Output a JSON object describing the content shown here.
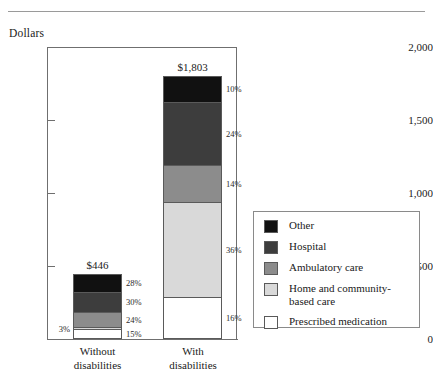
{
  "top_rule": "",
  "axis": {
    "y_title": "Dollars",
    "y_ticks": [
      "2,000",
      "1,500",
      "1,000",
      "500",
      "0"
    ],
    "y_tick_values": [
      2000,
      1500,
      1000,
      500,
      0
    ],
    "y_min": 0,
    "y_max": 2000
  },
  "bars": [
    {
      "category": "Without",
      "category_line2": "disabilities",
      "value_label": "$446",
      "value": 446,
      "segments": [
        {
          "name": "Other",
          "pct_label": "28%",
          "pct": 28,
          "color": "#111111",
          "label_side": "right"
        },
        {
          "name": "Hospital",
          "pct_label": "30%",
          "pct": 30,
          "color": "#3d3d3d",
          "label_side": "right"
        },
        {
          "name": "Ambulatory care",
          "pct_label": "24%",
          "pct": 24,
          "color": "#8c8c8c",
          "label_side": "right"
        },
        {
          "name": "Home and community-based care",
          "pct_label": "3%",
          "pct": 3,
          "color": "#d9d9d9",
          "label_side": "left"
        },
        {
          "name": "Prescribed medication",
          "pct_label": "15%",
          "pct": 15,
          "color": "#ffffff",
          "label_side": "right"
        }
      ]
    },
    {
      "category": "With",
      "category_line2": "disabilities",
      "value_label": "$1,803",
      "value": 1803,
      "segments": [
        {
          "name": "Other",
          "pct_label": "10%",
          "pct": 10,
          "color": "#111111",
          "label_side": "right"
        },
        {
          "name": "Hospital",
          "pct_label": "24%",
          "pct": 24,
          "color": "#3d3d3d",
          "label_side": "right"
        },
        {
          "name": "Ambulatory care",
          "pct_label": "14%",
          "pct": 14,
          "color": "#8c8c8c",
          "label_side": "right"
        },
        {
          "name": "Home and community-based care",
          "pct_label": "36%",
          "pct": 36,
          "color": "#d9d9d9",
          "label_side": "right"
        },
        {
          "name": "Prescribed medication",
          "pct_label": "16%",
          "pct": 16,
          "color": "#ffffff",
          "label_side": "right"
        }
      ]
    }
  ],
  "legend": {
    "items": [
      {
        "label": "Other",
        "color": "#111111"
      },
      {
        "label": "Hospital",
        "color": "#3d3d3d"
      },
      {
        "label": "Ambulatory care",
        "color": "#8c8c8c"
      },
      {
        "label": "Home and community-\nbased care",
        "color": "#d9d9d9"
      },
      {
        "label": "Prescribed medication",
        "color": "#ffffff"
      }
    ]
  },
  "chart_data": {
    "type": "bar",
    "subtype": "stacked-bar",
    "title": "",
    "xlabel": "",
    "ylabel": "Dollars",
    "ylim": [
      0,
      2000
    ],
    "yticks": [
      0,
      500,
      1000,
      1500,
      2000
    ],
    "ytick_labels": [
      "0",
      "500",
      "1,000",
      "1,500",
      "2,000"
    ],
    "grid": false,
    "legend_position": "right",
    "categories": [
      "Without disabilities",
      "With disabilities"
    ],
    "totals": [
      446,
      1803
    ],
    "total_labels": [
      "$446",
      "$1,803"
    ],
    "series": [
      {
        "name": "Prescribed medication",
        "percentages": [
          15,
          16
        ],
        "color": "#ffffff"
      },
      {
        "name": "Home and community-based care",
        "percentages": [
          3,
          36
        ],
        "color": "#d9d9d9"
      },
      {
        "name": "Ambulatory care",
        "percentages": [
          24,
          14
        ],
        "color": "#8c8c8c"
      },
      {
        "name": "Hospital",
        "percentages": [
          30,
          24
        ],
        "color": "#3d3d3d"
      },
      {
        "name": "Other",
        "percentages": [
          28,
          10
        ],
        "color": "#111111"
      }
    ],
    "stack_order_bottom_to_top": [
      "Prescribed medication",
      "Home and community-based care",
      "Ambulatory care",
      "Hospital",
      "Other"
    ],
    "annotations": [
      "$446",
      "$1,803",
      "28%",
      "30%",
      "24%",
      "3%",
      "15%",
      "10%",
      "24%",
      "14%",
      "36%",
      "16%"
    ]
  }
}
